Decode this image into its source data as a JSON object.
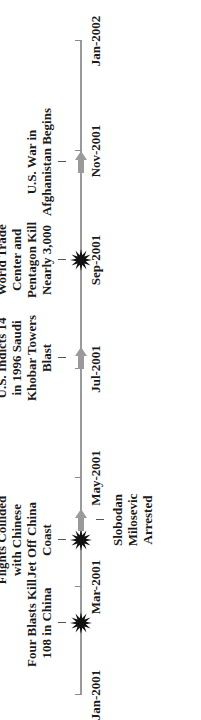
{
  "chart_data": {
    "type": "timeline",
    "orientation": "rotated -90deg (time runs bottom to top)",
    "axis": {
      "start": "Jan-2001",
      "end": "Jan-2002",
      "tick_labels": [
        "Jan-2001",
        "Mar-2001",
        "May-2001",
        "Jul-2001",
        "Sep-2001",
        "Nov-2001",
        "Jan-2002"
      ],
      "tick_positions": [
        24,
        132,
        241,
        350,
        459,
        568,
        678
      ]
    },
    "events": [
      {
        "label_lines": [
          "Four Blasts Kill",
          "108 in China"
        ],
        "date_approx": "Feb-2001",
        "marker": "star",
        "side": "above",
        "pos": 96
      },
      {
        "label_lines": [
          "U.S. Spy",
          "Flights Collided",
          "with Chinese",
          "Jet Off China",
          "Coast"
        ],
        "date_approx": "Apr-2001",
        "marker": "star",
        "side": "above",
        "pos": 179
      },
      {
        "label_lines": [
          "Slobodan",
          "Milosevic",
          "Arrested"
        ],
        "date_approx": "Apr-2001",
        "marker": "arrow",
        "side": "below",
        "pos": 199
      },
      {
        "label_lines": [
          "U.S. Indicts 14",
          "in 1996 Saudi",
          "Khobar Towers",
          "Blast"
        ],
        "date_approx": "Jun-2001",
        "marker": "arrow",
        "side": "above",
        "pos": 361
      },
      {
        "label_lines": [
          "Attack on",
          "World Trade",
          "Center and",
          "Pentagon Kill",
          "Nearly 3,000"
        ],
        "date_approx": "Sep-2001",
        "marker": "star",
        "side": "above",
        "pos": 459
      },
      {
        "label_lines": [
          "U.S. War in",
          "Afghanistan Begins"
        ],
        "date_approx": "Oct-2001",
        "marker": "arrow",
        "side": "above",
        "pos": 557
      }
    ],
    "colors": {
      "axis": "#9a9a9a",
      "star": "#111111",
      "arrow": "#9a9a9a",
      "text": "#1a1a1a"
    }
  }
}
